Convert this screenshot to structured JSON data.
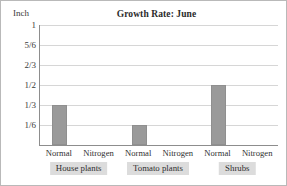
{
  "chart_data": {
    "type": "bar",
    "title": "Growth Rate: June",
    "xlabel": "",
    "ylabel": "Inch",
    "ylim": [
      0,
      1
    ],
    "grid": true,
    "legend": "none",
    "ytick_labels": [
      "1",
      "5/6",
      "2/3",
      "1/2",
      "1/3",
      "1/6"
    ],
    "ytick_values": [
      1,
      0.8333,
      0.6667,
      0.5,
      0.3333,
      0.1667
    ],
    "groups": [
      {
        "name": "House plants",
        "categories": [
          "Normal",
          "Nitrogen"
        ],
        "values": [
          0.3333,
          0
        ],
        "value_labels": [
          "1/3",
          "0"
        ]
      },
      {
        "name": "Tomato plants",
        "categories": [
          "Normal",
          "Nitrogen"
        ],
        "values": [
          0.1667,
          0
        ],
        "value_labels": [
          "1/6",
          "0"
        ]
      },
      {
        "name": "Shrubs",
        "categories": [
          "Normal",
          "Nitrogen"
        ],
        "values": [
          0.5,
          0
        ],
        "value_labels": [
          "1/2",
          "0"
        ]
      }
    ],
    "series": [
      {
        "name": "Growth",
        "categories": [
          "House plants - Normal",
          "House plants - Nitrogen",
          "Tomato plants - Normal",
          "Tomato plants - Nitrogen",
          "Shrubs - Normal",
          "Shrubs - Nitrogen"
        ],
        "values": [
          0.3333,
          0,
          0.1667,
          0,
          0.5,
          0
        ]
      }
    ],
    "colors": {
      "bar": "#9a9a9a",
      "gridline": "#d6d6d6",
      "axis": "#8d8d8d",
      "group_label_background": "#dcdcdc",
      "text": "#2f2f2f",
      "border": "#b9b9b9"
    }
  }
}
